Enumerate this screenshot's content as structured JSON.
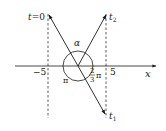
{
  "diagram": {
    "type": "phase-rotation-diagram",
    "axis": {
      "label": "x"
    },
    "ticks": {
      "neg": "−5",
      "pos": "5"
    },
    "vectors": [
      {
        "label_main": "t",
        "label_eq": "=0",
        "label_sub": "",
        "name": "t0"
      },
      {
        "label_main": "t",
        "label_sub": "2",
        "name": "t2"
      },
      {
        "label_main": "t",
        "label_sub": "1",
        "name": "t1"
      }
    ],
    "angles": {
      "alpha": "α",
      "pi": "π",
      "frac_num": "2",
      "frac_den": "3",
      "frac_pi": "π"
    },
    "colors": {
      "ink": "#1a1a1a",
      "background": "#ffffff"
    }
  }
}
